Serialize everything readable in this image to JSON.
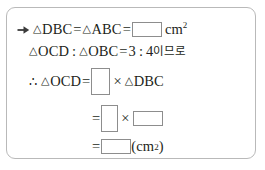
{
  "panel": {
    "border_color": "#b9b9b9",
    "background": "#ffffff",
    "text_color": "#231f20",
    "blank_border_color": "#8d8d8d"
  },
  "lines": [
    {
      "id": "line-1",
      "bullet": "arrow-right-icon",
      "tri1": "△",
      "label1": "DBC",
      "eq1": "=",
      "tri2": "△",
      "label2": "ABC",
      "eq2": "=",
      "blank": "",
      "unit": "cm",
      "unit_sup": "2"
    },
    {
      "id": "line-2",
      "tri1": "△",
      "label1": "OCD",
      "colon1": ":",
      "tri2": "△",
      "label2": "OBC",
      "eq": "=",
      "ratio_a": "3",
      "colon2": ":",
      "ratio_b": "4",
      "korean": "이므로"
    },
    {
      "id": "line-3",
      "therefore": "∴",
      "tri1": "△",
      "label1": "OCD",
      "eq": "=",
      "blank": "",
      "times": "×",
      "tri2": "△",
      "label2": "DBC"
    },
    {
      "id": "line-4",
      "eq": "=",
      "blank_a": "",
      "times": "×",
      "blank_b": ""
    },
    {
      "id": "line-5",
      "eq": "=",
      "blank": "",
      "paren_open": "(",
      "unit": "cm",
      "unit_sup": "2",
      "paren_close": ")"
    }
  ]
}
